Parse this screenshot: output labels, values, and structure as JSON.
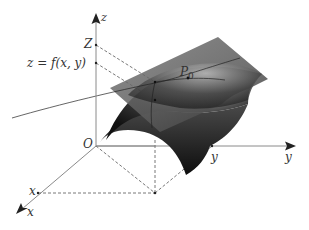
{
  "figure": {
    "labels": {
      "z_axis": "z",
      "Z_tick": "Z",
      "f_tick": "z = f(x, y)",
      "point": "P",
      "point_sub": "0",
      "origin": "O",
      "y_tick": "y",
      "y_axis": "y",
      "x_tick": "x",
      "x_axis": "x"
    },
    "colors": {
      "axis": "#8a8a8a",
      "dashed": "#555555",
      "surface_dark": "#1a1a1a",
      "surface_light": "#d8d8d8",
      "plane": "#6e6e6e",
      "text": "#333333"
    }
  }
}
